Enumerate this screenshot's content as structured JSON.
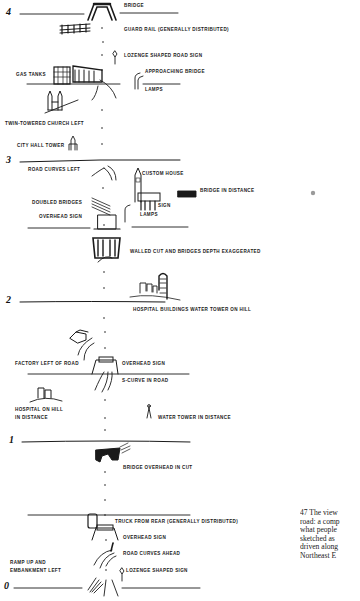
{
  "diagram": {
    "type": "route-sketch",
    "mile_markers": [
      {
        "label": "4",
        "y": 43
      },
      {
        "label": "3",
        "y": 167
      },
      {
        "label": "2",
        "y": 306
      },
      {
        "label": "1",
        "y": 442
      },
      {
        "label": "0",
        "y": 587
      }
    ],
    "labels": {
      "bridge": "BRIDGE",
      "guard_rail": "GUARD RAIL (GENERALLY DISTRIBUTED)",
      "lozenge_road_sign": "LOZENGE SHAPED ROAD SIGN",
      "approaching_bridge": "APPROACHING BRIDGE",
      "lamps_top": "LAMPS",
      "gas_tanks": "GAS TANKS",
      "twin_church": "TWIN-TOWERED CHURCH LEFT",
      "city_hall": "CITY HALL TOWER",
      "road_curves_left": "ROAD CURVES LEFT",
      "custom_house": "CUSTOM HOUSE",
      "bridge_in_distance": "BRIDGE IN DISTANCE",
      "doubled_bridges": "DOUBLED BRIDGES",
      "sign": "SIGN",
      "overhead_sign_3": "OVERHEAD SIGN",
      "lamps_3": "LAMPS",
      "walled_cut": "WALLED CUT AND BRIDGES  DEPTH EXAGGERATED",
      "hospital_buildings": "HOSPITAL BUILDINGS  WATER TOWER ON HILL",
      "factory_left": "FACTORY LEFT OF ROAD",
      "overhead_sign_2": "OVERHEAD SIGN",
      "s_curve": "S-CURVE IN ROAD",
      "hospital_on_hill_1": "HOSPITAL ON HILL",
      "hospital_on_hill_2": "IN DISTANCE",
      "water_tower_distance": "WATER TOWER IN DISTANCE",
      "bridge_overhead_cut": "BRIDGE OVERHEAD IN CUT",
      "truck_from_rear": "TRUCK FROM REAR (GENERALLY DISTRIBUTED)",
      "overhead_sign_0": "OVERHEAD SIGN",
      "road_curves_ahead": "ROAD CURVES AHEAD",
      "ramp_up_1": "RAMP UP AND",
      "ramp_up_2": "EMBANKMENT LEFT",
      "lozenge_sign": "LOZENGE SHAPED SIGN"
    }
  },
  "caption": {
    "lines": [
      "47  The view",
      "road: a comp",
      "what  people",
      "sketched  as",
      "driven  along",
      "Northeast  E"
    ]
  },
  "colors": {
    "ink": "#1a1a1a",
    "paper": "#ffffff"
  }
}
